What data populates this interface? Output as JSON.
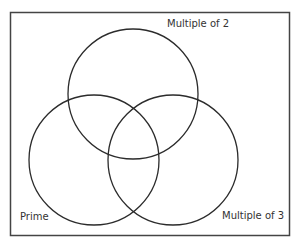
{
  "diagram": {
    "type": "venn",
    "sets": [
      {
        "id": "multiple_of_2",
        "label": "Multiple of 2",
        "cx": 133,
        "cy": 94,
        "r": 65
      },
      {
        "id": "prime",
        "label": "Prime",
        "cx": 94,
        "cy": 160,
        "r": 65
      },
      {
        "id": "multiple_of_3",
        "label": "Multiple of 3",
        "cx": 173,
        "cy": 160,
        "r": 65
      }
    ],
    "colors": {
      "stroke": "#2b2b2b",
      "frame": "#444444",
      "text": "#333333",
      "background": "#ffffff"
    }
  }
}
